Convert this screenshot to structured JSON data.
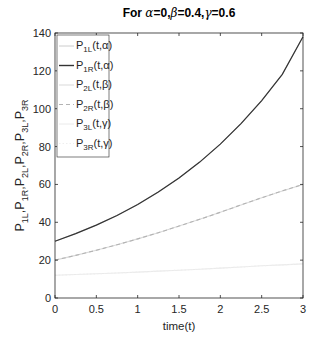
{
  "chart_data": {
    "type": "line",
    "title": "For α=0,β=0.4,γ=0.6",
    "xlabel": "time(t)",
    "ylabel": "P1L,P1R,P2L,P2R,P3L,P3R",
    "xlim": [
      0,
      3
    ],
    "ylim": [
      0,
      140
    ],
    "xticks": [
      0,
      0.5,
      1,
      1.5,
      2,
      2.5,
      3
    ],
    "xtick_labels": [
      "0",
      "0.5",
      "1",
      "1.5",
      "2",
      "2.5",
      "3"
    ],
    "yticks": [
      0,
      20,
      40,
      60,
      80,
      100,
      120,
      140
    ],
    "ytick_labels": [
      "0",
      "20",
      "40",
      "60",
      "80",
      "100",
      "120",
      "140"
    ],
    "grid": false,
    "legend_position": "northwest",
    "x": [
      0,
      0.25,
      0.5,
      0.75,
      1,
      1.25,
      1.5,
      1.75,
      2,
      2.25,
      2.5,
      2.75,
      3
    ],
    "series": [
      {
        "name": "P1L(t,α)",
        "style": "solid",
        "color": "#cccccc",
        "values": [
          30,
          34.0,
          38.5,
          43.6,
          49.4,
          56.0,
          63.4,
          71.8,
          81.3,
          92.1,
          104.3,
          118.2,
          138
        ]
      },
      {
        "name": "P1R(t,α)",
        "style": "solid",
        "color": "#333333",
        "values": [
          30,
          34.0,
          38.5,
          43.6,
          49.4,
          56.0,
          63.4,
          71.8,
          81.3,
          92.1,
          104.3,
          118.2,
          138
        ]
      },
      {
        "name": "P2L(t,β)",
        "style": "solid",
        "color": "#d9d9d9",
        "values": [
          20,
          22.5,
          25.2,
          28.1,
          31.2,
          34.5,
          38.0,
          41.6,
          45.3,
          49.2,
          53.0,
          56.6,
          60
        ]
      },
      {
        "name": "P2R(t,β)",
        "style": "dashed",
        "color": "#b3b3b3",
        "values": [
          20,
          22.5,
          25.2,
          28.1,
          31.2,
          34.5,
          38.0,
          41.6,
          45.3,
          49.2,
          53.0,
          56.6,
          60
        ]
      },
      {
        "name": "P3L(t,γ)",
        "style": "solid",
        "color": "#eaeaea",
        "values": [
          12,
          12.4,
          12.8,
          13.2,
          13.7,
          14.2,
          14.7,
          15.2,
          15.8,
          16.4,
          17.0,
          17.5,
          18
        ]
      },
      {
        "name": "P3R(t,γ)",
        "style": "dotted",
        "color": "#eeeeee",
        "values": [
          12,
          12.4,
          12.8,
          13.2,
          13.7,
          14.2,
          14.7,
          15.2,
          15.8,
          16.4,
          17.0,
          17.5,
          18
        ]
      }
    ]
  },
  "title_parts": {
    "prefix": "For ",
    "a": "α",
    "a_val": "=0,",
    "b": "β",
    "b_val": "=0.4,",
    "g": "γ",
    "g_val": "=0.6"
  },
  "legend": [
    {
      "base": "P",
      "sub": "1L",
      "arg": "(t,α)"
    },
    {
      "base": "P",
      "sub": "1R",
      "arg": "(t,α)"
    },
    {
      "base": "P",
      "sub": "2L",
      "arg": "(t,β)"
    },
    {
      "base": "P",
      "sub": "2R",
      "arg": "(t,β)"
    },
    {
      "base": "P",
      "sub": "3L",
      "arg": "(t,γ)"
    },
    {
      "base": "P",
      "sub": "3R",
      "arg": "(t,γ)"
    }
  ],
  "ylabel_parts": [
    {
      "base": "P",
      "sub": "1L",
      "sep": ","
    },
    {
      "base": "P",
      "sub": "1R",
      "sep": ","
    },
    {
      "base": "P",
      "sub": "2L",
      "sep": ","
    },
    {
      "base": "P",
      "sub": "2R",
      "sep": ","
    },
    {
      "base": "P",
      "sub": "3L",
      "sep": ","
    },
    {
      "base": "P",
      "sub": "3R",
      "sep": ""
    }
  ]
}
